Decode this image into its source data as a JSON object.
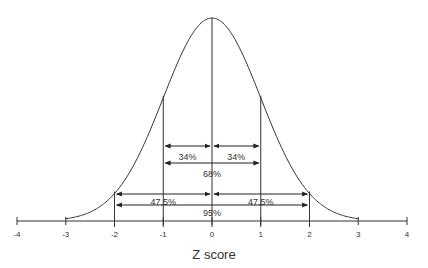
{
  "chart_data": {
    "type": "line",
    "title": "",
    "xlabel": "Z score",
    "ylabel": "",
    "xlim": [
      -4,
      4
    ],
    "x_ticks": [
      "-4",
      "-3",
      "-2",
      "-1",
      "0",
      "1",
      "2",
      "3",
      "4"
    ],
    "grid": false,
    "series": [
      {
        "name": "standard normal curve",
        "function": "normal_pdf",
        "mean": 0,
        "sd": 1
      }
    ],
    "vertical_lines": [
      -2,
      -1,
      0,
      1,
      2
    ],
    "annotations": [
      {
        "label": "34%",
        "from": -1,
        "to": 0
      },
      {
        "label": "34%",
        "from": 0,
        "to": 1
      },
      {
        "label": "68%",
        "from": -1,
        "to": 1
      },
      {
        "label": "47.5%",
        "from": -2,
        "to": 0
      },
      {
        "label": "47.5%",
        "from": 0,
        "to": 2
      },
      {
        "label": "95%",
        "from": -2,
        "to": 2
      }
    ]
  },
  "colors": {
    "line": "#333333",
    "background": "#ffffff"
  }
}
